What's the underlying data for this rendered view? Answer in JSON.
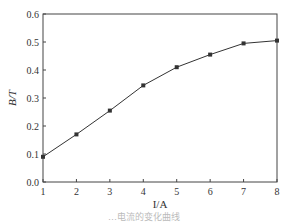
{
  "chart_data": {
    "type": "line",
    "title": "",
    "xlabel": "I/A",
    "ylabel": "B/T",
    "x": [
      1,
      2,
      3,
      4,
      5,
      6,
      7,
      8
    ],
    "series": [
      {
        "name": "B",
        "values": [
          0.09,
          0.17,
          0.255,
          0.345,
          0.41,
          0.455,
          0.495,
          0.505
        ],
        "marker": "square",
        "color": "#333333"
      }
    ],
    "xlim": [
      1,
      8
    ],
    "ylim": [
      0.0,
      0.6
    ],
    "xticks": [
      "1",
      "2",
      "3",
      "4",
      "5",
      "6",
      "7",
      "8"
    ],
    "yticks": [
      "0.0",
      "0.1",
      "0.2",
      "0.3",
      "0.4",
      "0.5",
      "0.6"
    ],
    "grid": false,
    "legend": null
  },
  "caption": "…电流的变化曲线"
}
